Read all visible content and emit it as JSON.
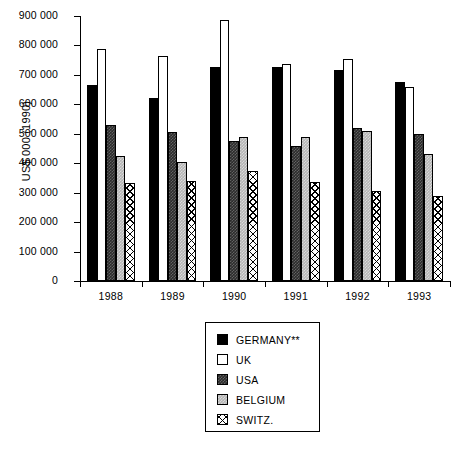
{
  "chart_data": {
    "type": "bar",
    "title": "",
    "xlabel": "",
    "ylabel": "US$ 000 (1990)",
    "categories": [
      "1988",
      "1989",
      "1990",
      "1991",
      "1992",
      "1993"
    ],
    "ylim": [
      0,
      900000
    ],
    "ytick_values": [
      0,
      100000,
      200000,
      300000,
      400000,
      500000,
      600000,
      700000,
      800000,
      900000
    ],
    "ytick_labels": [
      "0",
      "100 000",
      "200 000",
      "300 000",
      "400 000",
      "500 000",
      "600 000",
      "700 000",
      "800 000",
      "900 000"
    ],
    "grid": false,
    "legend_position": "below-center",
    "series": [
      {
        "name": "GERMANY**",
        "fill": "solid-black",
        "color": "#000000",
        "values": [
          665000,
          620000,
          728000,
          727000,
          715000,
          675000
        ]
      },
      {
        "name": "UK",
        "fill": "white-outline",
        "color": "#ffffff",
        "values": [
          788000,
          765000,
          885000,
          738000,
          755000,
          658000
        ]
      },
      {
        "name": "USA",
        "fill": "dark-gray",
        "color": "#2b2b2b",
        "values": [
          530000,
          505000,
          475000,
          460000,
          520000,
          500000
        ]
      },
      {
        "name": "BELGIUM",
        "fill": "light-gray",
        "color": "#b5b5b5",
        "values": [
          423000,
          405000,
          488000,
          488000,
          510000,
          430000
        ]
      },
      {
        "name": "SWITZ.",
        "fill": "crosshatch",
        "color": "#ffffff",
        "values": [
          333000,
          338000,
          375000,
          335000,
          305000,
          288000
        ]
      }
    ]
  },
  "legend": {
    "items": [
      {
        "label": "GERMANY**",
        "swatch": "legend-swatch-germany"
      },
      {
        "label": "UK",
        "swatch": "legend-swatch-uk"
      },
      {
        "label": "USA",
        "swatch": "legend-swatch-usa"
      },
      {
        "label": "BELGIUM",
        "swatch": "legend-swatch-belgium"
      },
      {
        "label": "SWITZ.",
        "swatch": "legend-swatch-switz"
      }
    ]
  }
}
